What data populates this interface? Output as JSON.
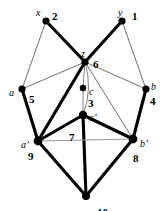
{
  "figure": {
    "type": "graph-diagram",
    "background_color": "#ffffff",
    "ink_color": "#000000",
    "thin_edge_color": "#4a4a4a",
    "faint_edge_color": "#9a9a9a",
    "width": 166,
    "height": 211
  },
  "nodes": [
    {
      "id": "x",
      "name": "x",
      "number": "2",
      "cx": 46,
      "cy": 21,
      "r": 3.6,
      "name_dx": -10,
      "name_dy": -13,
      "num_dx": 6,
      "num_dy": -10
    },
    {
      "id": "y",
      "name": "y",
      "number": "1",
      "cx": 122,
      "cy": 21,
      "r": 3.6,
      "name_dx": -4,
      "name_dy": -13,
      "num_dx": 10,
      "num_dy": -10
    },
    {
      "id": "z",
      "name": "z",
      "number": "6",
      "cx": 85,
      "cy": 62,
      "r": 3.6,
      "name_dx": -4,
      "name_dy": -13,
      "num_dx": 8,
      "num_dy": -3
    },
    {
      "id": "a",
      "name": "a",
      "number": "5",
      "cx": 22,
      "cy": 89,
      "r": 3.6,
      "name_dx": -13,
      "name_dy": -1,
      "num_dx": 7,
      "num_dy": 5
    },
    {
      "id": "b",
      "name": "b",
      "number": "4",
      "cx": 146,
      "cy": 89,
      "r": 3.6,
      "name_dx": 5,
      "name_dy": -7,
      "num_dx": 4,
      "num_dy": 7
    },
    {
      "id": "c",
      "name": "c",
      "number": "3",
      "cx": 83,
      "cy": 88,
      "r": 3.2,
      "name_dx": 6,
      "name_dy": -1,
      "num_dx": 5,
      "num_dy": 10
    },
    {
      "id": "cp",
      "name": "c’",
      "number": "7",
      "cx": 83,
      "cy": 115,
      "r": 4.2,
      "name_dx": 6,
      "name_dy": -2,
      "num_dx": -14,
      "num_dy": 17
    },
    {
      "id": "ap",
      "name": "a’",
      "number": "9",
      "cx": 38,
      "cy": 141,
      "r": 4.4,
      "name_dx": -17,
      "name_dy": -1,
      "num_dx": -10,
      "num_dy": 10
    },
    {
      "id": "bp",
      "name": "b’",
      "number": "8",
      "cx": 133,
      "cy": 139,
      "r": 4.4,
      "name_dx": 7,
      "name_dy": 0,
      "num_dx": 0,
      "num_dy": 14
    },
    {
      "id": "u",
      "name": "u",
      "number": "10",
      "cx": 86,
      "cy": 196,
      "r": 4.0,
      "name_dx": -2,
      "name_dy": 13,
      "num_dx": 11,
      "num_dy": 11
    }
  ],
  "edges": [
    {
      "from": "x",
      "to": "z",
      "weight": "thick"
    },
    {
      "from": "y",
      "to": "z",
      "weight": "thick"
    },
    {
      "from": "x",
      "to": "a",
      "weight": "thin"
    },
    {
      "from": "y",
      "to": "b",
      "weight": "thin"
    },
    {
      "from": "z",
      "to": "a",
      "weight": "thin"
    },
    {
      "from": "z",
      "to": "b",
      "weight": "thin"
    },
    {
      "from": "a",
      "to": "ap",
      "weight": "thick"
    },
    {
      "from": "b",
      "to": "bp",
      "weight": "thick"
    },
    {
      "from": "z",
      "to": "ap",
      "weight": "thick"
    },
    {
      "from": "z",
      "to": "bp",
      "weight": "thin"
    },
    {
      "from": "z",
      "to": "c",
      "weight": "hairline"
    },
    {
      "from": "c",
      "to": "cp",
      "weight": "hairline"
    },
    {
      "from": "cp",
      "to": "ap",
      "weight": "thick"
    },
    {
      "from": "cp",
      "to": "bp",
      "weight": "thick"
    },
    {
      "from": "cp",
      "to": "u",
      "weight": "thick"
    },
    {
      "from": "ap",
      "to": "u",
      "weight": "thick"
    },
    {
      "from": "bp",
      "to": "u",
      "weight": "thick"
    },
    {
      "from": "ap",
      "to": "bp",
      "weight": "faint"
    }
  ],
  "curved_edges": [
    {
      "from": "z",
      "to": "cp",
      "weight": "hairline",
      "bulge": -9
    }
  ]
}
